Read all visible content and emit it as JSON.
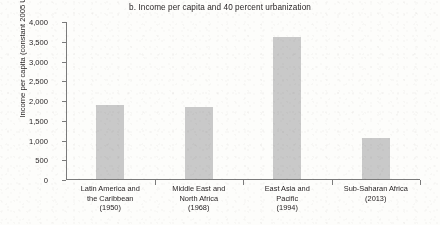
{
  "chart_data": {
    "type": "bar",
    "title": "b. Income per capita and 40 percent urbanization",
    "xlabel": "",
    "ylabel": "Income per capita (constant 2005 US$)",
    "ylim": [
      0,
      4000
    ],
    "ytick_labels": [
      "4,000",
      "3,500",
      "3,000",
      "2,500",
      "2,000",
      "1,500",
      "1,000",
      "500",
      "0"
    ],
    "ytick_values": [
      4000,
      3500,
      3000,
      2500,
      2000,
      1500,
      1000,
      500,
      0
    ],
    "grid": false,
    "legend": false,
    "bar_color": "#c9c9c9",
    "axis_color": "#7b7b7b",
    "categories": [
      {
        "name": "Latin America and the Caribbean",
        "line1": "Latin America and",
        "line2": "the Caribbean",
        "year": "(1950)"
      },
      {
        "name": "Middle East and North Africa",
        "line1": "Middle East and",
        "line2": "North Africa",
        "year": "(1968)"
      },
      {
        "name": "East Asia and Pacific",
        "line1": "East Asia and",
        "line2": "Pacific",
        "year": "(1994)"
      },
      {
        "name": "Sub-Saharan Africa",
        "line1": "Sub-Saharan Africa",
        "line2": "",
        "year": "(2013)"
      }
    ],
    "values": [
      1880,
      1820,
      3600,
      1030
    ]
  }
}
